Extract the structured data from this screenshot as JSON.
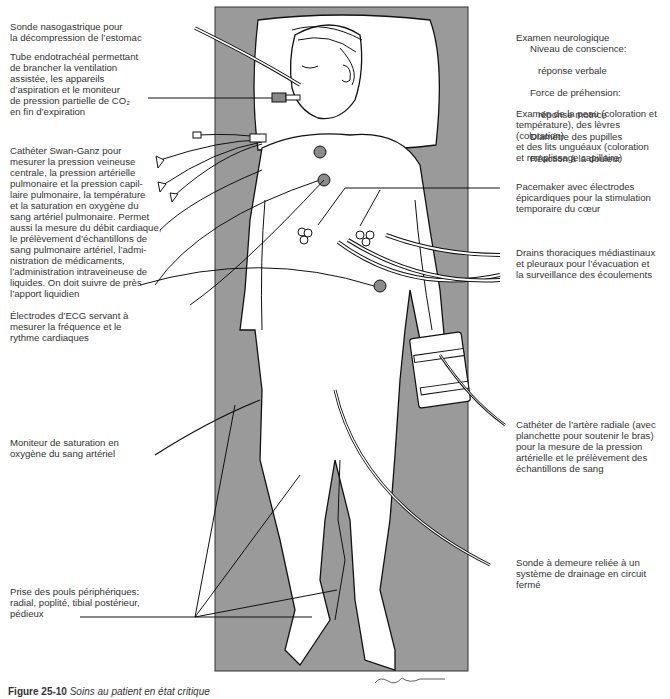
{
  "figure": {
    "caption_number": "Figure 25-10",
    "caption_text": "Soins au patient en état critique",
    "colors": {
      "bed": "#9a9a9a",
      "line": "#111111",
      "electrode": "#8a8a8a",
      "background": "#ffffff"
    },
    "signature": "Boyland"
  },
  "labels": {
    "left": [
      {
        "id": "nasogastric",
        "text": "Sonde nasogastrique pour\nla décompression de l’estomac"
      },
      {
        "id": "endotracheal",
        "text": "Tube endotrachéal permettant\nde brancher la ventilation\nassistée, les appareils\nd’aspiration et le moniteur\nde pression partielle de CO₂\nen fin d’expiration"
      },
      {
        "id": "swan-ganz",
        "text": "Cathéter Swan-Ganz pour\nmesurer la pression veineuse\ncentrale, la pression artérielle\npulmonaire et la pression capil-\nlaire pulmonaire, la température\net la saturation en oxygène du\nsang artériel pulmonaire. Permet\naussi la mesure du débit cardiaque,\nle prélèvement d’échantillons de\nsang pulmonaire artériel, l’admi-\nnistration de médicaments,\nl’administration intraveineuse de\nliquides. On doit suivre de près\nl’apport liquidien"
      },
      {
        "id": "ecg",
        "text": "Électrodes d’ECG servant à\nmesurer la fréquence et le\nrythme cardiaques"
      },
      {
        "id": "oximetry",
        "text": "Moniteur de saturation en\noxygène du sang artériel"
      },
      {
        "id": "pulses",
        "text": "Prise des pouls périphériques:\nradial, poplité, tibial postérieur,\npédieux"
      }
    ],
    "right": [
      {
        "id": "neuro-title",
        "text": "Examen neurologique"
      },
      {
        "id": "neuro-consciousness",
        "text": "Niveau de conscience:"
      },
      {
        "id": "neuro-verbal",
        "text": "réponse verbale"
      },
      {
        "id": "neuro-grip",
        "text": "Force de préhension:"
      },
      {
        "id": "neuro-motor",
        "text": "réponse motrice"
      },
      {
        "id": "neuro-pupils",
        "text": "Diamètre des pupilles"
      },
      {
        "id": "neuro-pain",
        "text": "Réaction à la douleur"
      },
      {
        "id": "skin",
        "text": "Examen de la peau (coloration et\ntempérature), des lèvres (coloration)\net des lits unguéaux (coloration\net remplissage capillaire)"
      },
      {
        "id": "pacemaker",
        "text": "Pacemaker avec électrodes\népicardiques pour la stimulation\ntemporaire du cœur"
      },
      {
        "id": "chest-drains",
        "text": "Drains thoraciques médiastinaux\net pleuraux pour l’évacuation et\nla surveillance des écoulements"
      },
      {
        "id": "radial-catheter",
        "text": "Cathéter de l’artère radiale (avec\nplanchette pour soutenir le bras)\npour la mesure de la pression\nartérielle et le prélèvement des\néchantillons de sang"
      },
      {
        "id": "foley",
        "text": "Sonde à demeure reliée à un\nsystème de drainage en circuit\nfermé"
      }
    ]
  }
}
